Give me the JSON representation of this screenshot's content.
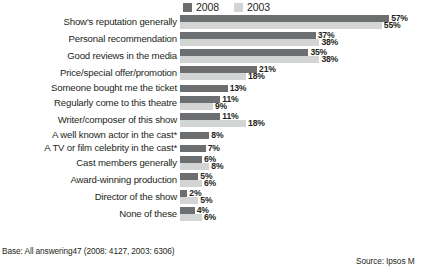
{
  "chart_data": {
    "type": "bar",
    "orientation": "horizontal",
    "title": "",
    "xlabel": "",
    "ylabel": "",
    "xlim": [
      0,
      60
    ],
    "grid": false,
    "legend_position": "top",
    "categories": [
      "Show's reputation generally",
      "Personal recommendation",
      "Good reviews in the media",
      "Price/special offer/promotion",
      "Someone bought me the ticket",
      "Regularly come to this theatre",
      "Writer/composer of this show",
      "A well known actor in the cast*",
      "A TV or film celebrity in the cast*",
      "Cast members generally",
      "Award-winning production",
      "Director of the show",
      "None of these"
    ],
    "series": [
      {
        "name": "2008",
        "color": "#6d6e70",
        "values": [
          57,
          37,
          35,
          21,
          13,
          11,
          11,
          8,
          7,
          6,
          5,
          2,
          4
        ],
        "labels": [
          "57%",
          "37%",
          "35%",
          "21%",
          "13%",
          "11%",
          "11%",
          "8%",
          "7%",
          "6%",
          "5%",
          "2%",
          "4%"
        ]
      },
      {
        "name": "2003",
        "color": "#d3d4d4",
        "values": [
          55,
          38,
          38,
          18,
          null,
          9,
          18,
          null,
          null,
          8,
          6,
          5,
          6
        ],
        "labels": [
          "55%",
          "38%",
          "38%",
          "18%",
          "",
          "9%",
          "18%",
          "",
          "",
          "8%",
          "6%",
          "5%",
          "6%"
        ]
      }
    ]
  },
  "legend": {
    "items": [
      {
        "label": "2008",
        "color": "#6d6e70"
      },
      {
        "label": "2003",
        "color": "#d3d4d4"
      }
    ]
  },
  "notes": {
    "base": "Base: All answering47 (2008: 4127, 2003: 6306)",
    "source": "Source: Ipsos M"
  }
}
